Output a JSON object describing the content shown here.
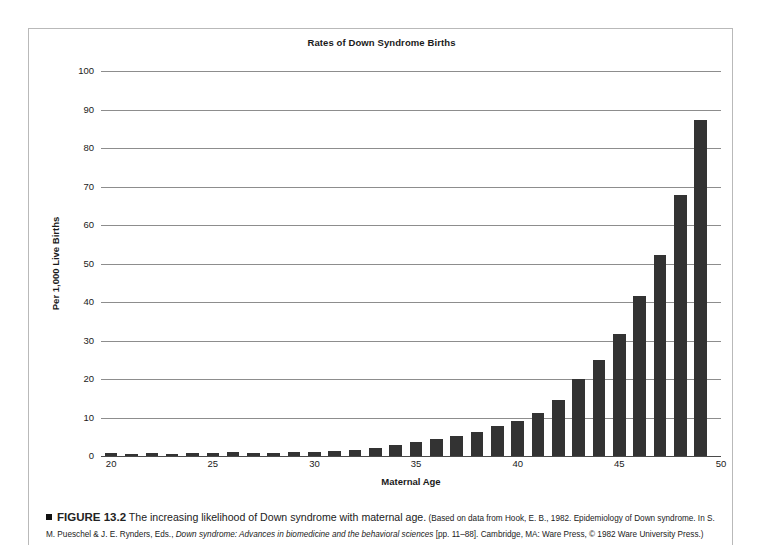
{
  "figure": {
    "marker_icon": "black-square-bullet",
    "number_label": "FIGURE 13.2",
    "lead_text": "The increasing likelihood of Down syndrome with maternal age.",
    "source_part1": "(Based on data from Hook, E. B., 1982. Epidemiology of Down syndrome. In S. M. Pueschel & J. E. Rynders, Eds., ",
    "source_italic1": "Down syndrome: Advances in biomedicine and the behavioral sciences",
    "source_part2": " [pp. 11–88]. Cambridge, MA: Ware Press, © 1982 Ware University Press.)"
  },
  "colors": {
    "bar": "#333333",
    "gridline": "#8d8d8d",
    "axis": "#4a4a4a",
    "frame": "#b9b9b9",
    "background": "#ffffff",
    "text": "#1a1a1a"
  },
  "chart_data": {
    "type": "bar",
    "title": "Rates of Down Syndrome Births",
    "xlabel": "Maternal Age",
    "ylabel": "Per 1,000 Live Births",
    "xlim": [
      19.5,
      50
    ],
    "ylim": [
      0,
      100
    ],
    "ytick_values": [
      0,
      10,
      20,
      30,
      40,
      50,
      60,
      70,
      80,
      90,
      100
    ],
    "ytick_labels": [
      "0",
      "10",
      "20",
      "30",
      "40",
      "50",
      "60",
      "70",
      "80",
      "90",
      "100"
    ],
    "xtick_values": [
      20,
      25,
      30,
      35,
      40,
      45,
      50
    ],
    "xtick_labels": [
      "20",
      "25",
      "30",
      "35",
      "40",
      "45",
      "50"
    ],
    "grid": "horizontal",
    "legend": "none",
    "categories": [
      20,
      21,
      22,
      23,
      24,
      25,
      26,
      27,
      28,
      29,
      30,
      31,
      32,
      33,
      34,
      35,
      36,
      37,
      38,
      39,
      40,
      41,
      42,
      43,
      44,
      45,
      46,
      47,
      48,
      49
    ],
    "values": [
      0.7,
      0.6,
      0.7,
      0.6,
      0.8,
      0.9,
      1.0,
      0.9,
      0.9,
      1.1,
      1.0,
      1.3,
      1.6,
      2.1,
      2.8,
      3.6,
      4.4,
      5.3,
      6.2,
      7.7,
      9.1,
      11.1,
      14.5,
      20.0,
      25.0,
      31.7,
      41.6,
      52.2,
      67.7,
      87.3
    ]
  }
}
